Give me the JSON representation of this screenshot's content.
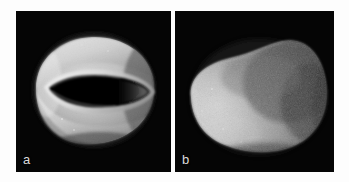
{
  "figure": {
    "background_color": "#fdfdfd",
    "panel_background_color": "#050505",
    "label_color": "#dcdcdc",
    "caption": "",
    "panels": [
      {
        "id": "a",
        "label": "a",
        "view": "ventral",
        "subject": "gastropod-shell",
        "imaging": "scanning-electron-micrograph",
        "description": "Ovoid shell in ventral view with a long narrow lens-shaped aperture slit across the middle; bright rounded margins, dark aperture interior.",
        "features": [
          {
            "name": "shell-body",
            "shape": "ovoid",
            "tone": "light-gray"
          },
          {
            "name": "aperture-slit",
            "shape": "lens",
            "tone": "black"
          },
          {
            "name": "outer-lip",
            "shape": "arc",
            "tone": "bright-gray"
          },
          {
            "name": "inner-lip",
            "shape": "arc",
            "tone": "mid-gray"
          }
        ]
      },
      {
        "id": "b",
        "label": "b",
        "view": "dorsal",
        "subject": "gastropod-shell",
        "imaging": "scanning-electron-micrograph",
        "description": "Same shell in dorsal view: smooth rounded pear-shaped dome, brighter at the left and lower-left, darker granular shading toward the upper right.",
        "features": [
          {
            "name": "shell-dome",
            "shape": "pear-ovoid",
            "tone": "light-gray"
          },
          {
            "name": "dorsal-shading",
            "shape": "gradient",
            "tone": "dark-gray"
          },
          {
            "name": "surface-texture",
            "shape": "granular",
            "tone": "mottled"
          }
        ]
      }
    ]
  }
}
